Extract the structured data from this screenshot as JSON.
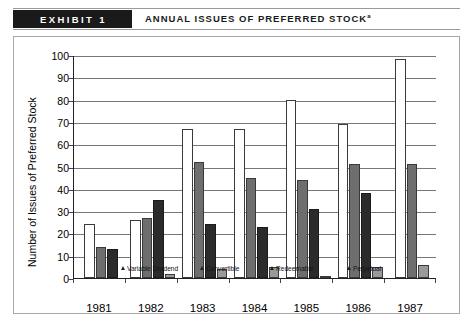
{
  "header": {
    "exhibit_label": "EXHIBIT 1",
    "title": "ANNUAL ISSUES OF PREFERRED STOCK",
    "title_superscript": "a"
  },
  "chart_data": {
    "type": "bar",
    "title": "Annual Issues of Preferred Stock",
    "xlabel": "",
    "ylabel": "Number of Issues of Preferred Stock",
    "ylim": [
      0,
      100
    ],
    "ytick_labels": [
      "100",
      "90",
      "80",
      "70",
      "60",
      "50",
      "40",
      "30",
      "20",
      "10",
      "0"
    ],
    "ytick_values": [
      100,
      90,
      80,
      70,
      60,
      50,
      40,
      30,
      20,
      10,
      0
    ],
    "grid": true,
    "legend_position": "inside-bottom",
    "categories": [
      "1981",
      "1982",
      "1983",
      "1984",
      "1985",
      "1986",
      "1987"
    ],
    "series": [
      {
        "name": "Variable Dividend",
        "color": "#ffffff",
        "values": [
          24,
          26,
          67,
          67,
          80,
          69,
          98
        ]
      },
      {
        "name": "Convertible",
        "color": "#6e6e6e",
        "values": [
          14,
          27,
          21,
          24,
          23,
          39,
          51
        ]
      },
      {
        "name": "Redeemable",
        "color": "#2b2b2b",
        "values": [
          0,
          13,
          35,
          24,
          23,
          31,
          38
        ]
      },
      {
        "name": "Perpetual",
        "color": "#9a9a9a",
        "values": [
          0,
          2,
          4,
          5,
          1,
          5,
          6
        ]
      }
    ],
    "bars_by_year": [
      {
        "year": "1981",
        "bars": [
          {
            "series": "Variable Dividend",
            "value": 24,
            "style": "variable"
          },
          {
            "series": "Convertible",
            "value": 14,
            "style": "convertible"
          },
          {
            "series": "Redeemable",
            "value": 13,
            "style": "redeemable"
          }
        ]
      },
      {
        "year": "1982",
        "bars": [
          {
            "series": "Variable Dividend",
            "value": 26,
            "style": "variable"
          },
          {
            "series": "Convertible",
            "value": 27,
            "style": "convertible"
          },
          {
            "series": "Redeemable",
            "value": 35,
            "style": "redeemable"
          },
          {
            "series": "Perpetual",
            "value": 2,
            "style": "perpetual"
          }
        ]
      },
      {
        "year": "1983",
        "bars": [
          {
            "series": "Variable Dividend",
            "value": 67,
            "style": "variable"
          },
          {
            "series": "Convertible",
            "value": 52,
            "style": "convertible"
          },
          {
            "series": "Redeemable",
            "value": 24,
            "style": "redeemable"
          },
          {
            "series": "Perpetual",
            "value": 4,
            "style": "perpetual"
          }
        ]
      },
      {
        "year": "1984",
        "bars": [
          {
            "series": "Variable Dividend",
            "value": 67,
            "style": "variable"
          },
          {
            "series": "Convertible",
            "value": 45,
            "style": "convertible"
          },
          {
            "series": "Redeemable",
            "value": 23,
            "style": "redeemable"
          },
          {
            "series": "Perpetual",
            "value": 5,
            "style": "perpetual"
          }
        ]
      },
      {
        "year": "1985",
        "bars": [
          {
            "series": "Variable Dividend",
            "value": 80,
            "style": "variable"
          },
          {
            "series": "Convertible",
            "value": 44,
            "style": "convertible"
          },
          {
            "series": "Redeemable",
            "value": 31,
            "style": "redeemable"
          },
          {
            "series": "Perpetual",
            "value": 1,
            "style": "perpetual"
          }
        ]
      },
      {
        "year": "1986",
        "bars": [
          {
            "series": "Variable Dividend",
            "value": 69,
            "style": "variable"
          },
          {
            "series": "Convertible",
            "value": 51,
            "style": "convertible"
          },
          {
            "series": "Redeemable",
            "value": 38,
            "style": "redeemable"
          },
          {
            "series": "Perpetual",
            "value": 5,
            "style": "perpetual"
          }
        ]
      },
      {
        "year": "1987",
        "bars": [
          {
            "series": "Variable Dividend",
            "value": 98,
            "style": "variable"
          },
          {
            "series": "Convertible",
            "value": 51,
            "style": "convertible"
          },
          {
            "series": "Perpetual",
            "value": 6,
            "style": "perpetual"
          }
        ]
      }
    ],
    "legend": [
      {
        "label": "Variable Dividend",
        "marker": "triangle-up"
      },
      {
        "label": "Convertible",
        "marker": "triangle-up"
      },
      {
        "label": "Redeemable",
        "marker": "triangle-up"
      },
      {
        "label": "Perpetual",
        "marker": "triangle-up"
      }
    ]
  }
}
